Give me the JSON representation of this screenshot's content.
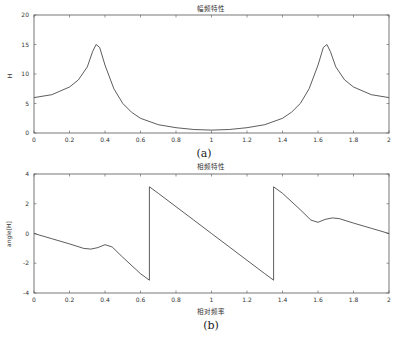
{
  "chart_data": [
    {
      "type": "line",
      "title": "幅频特性",
      "xlabel": "",
      "ylabel": "H",
      "caption": "(a)",
      "xlim": [
        0,
        2
      ],
      "ylim": [
        0,
        20
      ],
      "xticks": [
        "0",
        "0.2",
        "0.4",
        "0.6",
        "0.8",
        "1",
        "1.2",
        "1.4",
        "1.6",
        "1.8",
        "2"
      ],
      "yticks": [
        "0",
        "5",
        "10",
        "15",
        "20"
      ],
      "grid": false,
      "series": [
        {
          "name": "H",
          "x": [
            0,
            0.1,
            0.2,
            0.25,
            0.3,
            0.33,
            0.35,
            0.37,
            0.4,
            0.45,
            0.5,
            0.55,
            0.6,
            0.7,
            0.8,
            0.9,
            1.0,
            1.1,
            1.2,
            1.3,
            1.4,
            1.45,
            1.5,
            1.55,
            1.6,
            1.63,
            1.65,
            1.67,
            1.7,
            1.75,
            1.8,
            1.9,
            2.0
          ],
          "y": [
            6.0,
            6.5,
            7.8,
            9.0,
            11.2,
            13.8,
            15.0,
            14.5,
            11.5,
            7.5,
            5.0,
            3.5,
            2.5,
            1.4,
            0.9,
            0.6,
            0.5,
            0.6,
            0.9,
            1.4,
            2.5,
            3.5,
            5.0,
            7.5,
            11.5,
            14.5,
            15.0,
            13.8,
            11.2,
            9.0,
            7.8,
            6.5,
            6.0
          ]
        }
      ]
    },
    {
      "type": "line",
      "title": "相频特性",
      "xlabel": "相对频率",
      "ylabel": "angle[H]",
      "caption": "(b)",
      "xlim": [
        0,
        2
      ],
      "ylim": [
        -4,
        4
      ],
      "xticks": [
        "0",
        "0.2",
        "0.4",
        "0.6",
        "0.8",
        "1",
        "1.2",
        "1.4",
        "1.6",
        "1.8",
        "2"
      ],
      "yticks": [
        "-4",
        "-2",
        "0",
        "2",
        "4"
      ],
      "grid": false,
      "series": [
        {
          "name": "angle[H]",
          "x": [
            0,
            0.1,
            0.2,
            0.28,
            0.32,
            0.36,
            0.4,
            0.44,
            0.5,
            0.6,
            0.65,
            0.65,
            0.7,
            0.8,
            0.9,
            1.0,
            1.1,
            1.2,
            1.3,
            1.35,
            1.35,
            1.4,
            1.5,
            1.56,
            1.6,
            1.64,
            1.68,
            1.72,
            1.8,
            1.9,
            2.0
          ],
          "y": [
            0,
            -0.35,
            -0.7,
            -1.0,
            -1.05,
            -0.95,
            -0.75,
            -0.9,
            -1.6,
            -2.7,
            -3.14,
            3.14,
            2.7,
            1.8,
            0.9,
            0,
            -0.9,
            -1.8,
            -2.7,
            -3.14,
            3.14,
            2.7,
            1.6,
            0.9,
            0.75,
            0.95,
            1.05,
            1.0,
            0.7,
            0.35,
            0
          ]
        }
      ]
    }
  ]
}
